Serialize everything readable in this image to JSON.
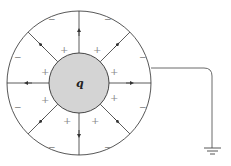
{
  "diagram": {
    "charge_label": "q",
    "plus_sign": "+",
    "minus_sign": "−",
    "inner_fill": "#d4d4d4",
    "line_color": "#333333",
    "outer_circle": {
      "cx": 79,
      "cy": 83,
      "r": 72
    },
    "inner_sphere": {
      "cx": 79,
      "cy": 83,
      "r": 30
    },
    "field_lines": 8,
    "ground_label": "ground"
  }
}
